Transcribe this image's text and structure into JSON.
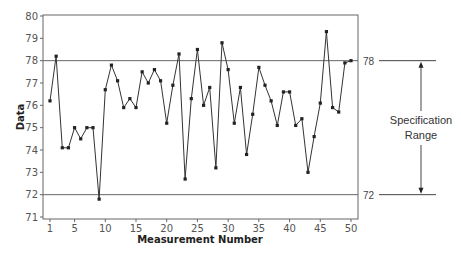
{
  "chart_data": {
    "type": "line",
    "title": "",
    "xlabel": "Measurement Number",
    "ylabel": "Data",
    "x": [
      1,
      2,
      3,
      4,
      5,
      6,
      7,
      8,
      9,
      10,
      11,
      12,
      13,
      14,
      15,
      16,
      17,
      18,
      19,
      20,
      21,
      22,
      23,
      24,
      25,
      26,
      27,
      28,
      29,
      30,
      31,
      32,
      33,
      34,
      35,
      36,
      37,
      38,
      39,
      40,
      41,
      42,
      43,
      44,
      45,
      46,
      47,
      48,
      49,
      50
    ],
    "values": [
      76.2,
      78.2,
      74.1,
      74.1,
      75.0,
      74.5,
      75.0,
      75.0,
      71.8,
      76.7,
      77.8,
      77.1,
      75.9,
      76.3,
      75.9,
      77.5,
      77.0,
      77.6,
      77.1,
      75.2,
      76.9,
      78.3,
      72.7,
      76.3,
      78.5,
      76.0,
      76.8,
      73.2,
      78.8,
      77.6,
      75.2,
      76.8,
      73.8,
      75.6,
      77.7,
      76.9,
      76.2,
      75.1,
      76.6,
      76.6,
      75.1,
      75.4,
      73.0,
      74.6,
      76.1,
      79.3,
      75.9,
      75.7,
      77.9,
      78.0
    ],
    "xlim": [
      0,
      51
    ],
    "ylim": [
      71,
      80
    ],
    "xticks": [
      1,
      5,
      10,
      15,
      20,
      25,
      30,
      35,
      40,
      45,
      50
    ],
    "yticks": [
      71,
      72,
      73,
      74,
      75,
      76,
      77,
      78,
      79,
      80
    ],
    "reference_lines": [
      {
        "value": 78,
        "label": "78"
      },
      {
        "value": 72,
        "label": "72"
      }
    ],
    "annotation": {
      "line1": "Specification",
      "line2": "Range"
    },
    "grid": false,
    "legend": "none"
  }
}
